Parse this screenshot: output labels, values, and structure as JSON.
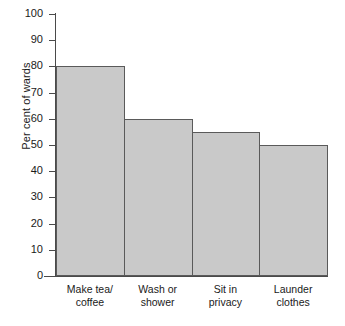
{
  "chart_data": {
    "type": "bar",
    "title": "",
    "xlabel": "",
    "ylabel": "Per cent of wards",
    "categories": [
      "Make tea/ coffee",
      "Wash or shower",
      "Sit in privacy",
      "Launder clothes"
    ],
    "category_lines": [
      [
        "Make tea/",
        "coffee"
      ],
      [
        "Wash or",
        "shower"
      ],
      [
        "Sit in",
        "privacy"
      ],
      [
        "Launder",
        "clothes"
      ]
    ],
    "values": [
      80,
      60,
      55,
      50
    ],
    "ylim": [
      0,
      100
    ],
    "ytick_step": 10,
    "ytick_labels": [
      "100",
      "90",
      "80",
      "70",
      "60",
      "50",
      "40",
      "30",
      "20",
      "10",
      "0"
    ],
    "ytick_values": [
      100,
      90,
      80,
      70,
      60,
      50,
      40,
      30,
      20,
      10,
      0
    ],
    "grid": false,
    "legend": "none",
    "bar_fill_color": "#c9c9c9",
    "bar_border_color": "#5a5a5a",
    "axis_color": "#4a4a4a"
  }
}
